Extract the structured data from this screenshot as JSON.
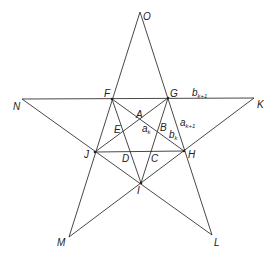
{
  "diagram": {
    "stroke_color": "#333333",
    "background": "#ffffff",
    "points": {
      "O": [
        140,
        12
      ],
      "F": [
        112,
        99
      ],
      "G": [
        168,
        98
      ],
      "N": [
        22,
        99
      ],
      "K": [
        254,
        98
      ],
      "J": [
        95,
        152
      ],
      "H": [
        184,
        151
      ],
      "I": [
        141,
        183
      ],
      "M": [
        69,
        237
      ],
      "L": [
        212,
        235
      ],
      "A": [
        140,
        121
      ],
      "E": [
        122,
        130
      ],
      "B": [
        158,
        130
      ],
      "D": [
        129,
        152
      ],
      "C": [
        152,
        152
      ]
    },
    "labels": {
      "O": "O",
      "F": "F",
      "G": "G",
      "N": "N",
      "K": "K",
      "J": "J",
      "H": "H",
      "I": "I",
      "M": "M",
      "L": "L",
      "A": "A",
      "B": "B",
      "C": "C",
      "D": "D",
      "E": "E"
    },
    "segment_labels": {
      "a_k": {
        "base": "a",
        "sub": "k"
      },
      "b_k": {
        "base": "b",
        "sub": "k"
      },
      "a_k1": {
        "base": "a",
        "sub": "k+1"
      },
      "b_k1": {
        "base": "b",
        "sub": "k+1"
      }
    }
  }
}
